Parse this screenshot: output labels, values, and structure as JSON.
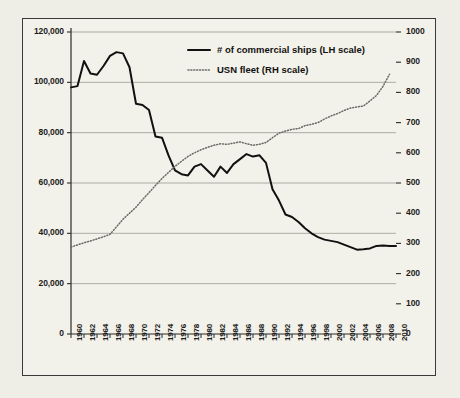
{
  "chart_data": {
    "type": "line",
    "title": "",
    "subtitle": "",
    "xlabel": "",
    "ylabel": "",
    "y2label": "",
    "grid": true,
    "legend_position": "top-center",
    "xlim": [
      1960,
      2010
    ],
    "ylim": [
      0,
      120000
    ],
    "y2lim": [
      0,
      1000
    ],
    "x_tick_labels": [
      "1960",
      "1962",
      "1964",
      "1966",
      "1968",
      "1970",
      "1972",
      "1974",
      "1976",
      "1978",
      "1980",
      "1982",
      "1984",
      "1986",
      "1988",
      "1990",
      "1992",
      "1994",
      "1996",
      "1998",
      "2000",
      "2002",
      "2004",
      "2006",
      "2008",
      "2010"
    ],
    "y_left_tick_labels": [
      "0",
      "20,000",
      "40,000",
      "60,000",
      "80,000",
      "100,000",
      "120,000"
    ],
    "y_left_tick_values": [
      0,
      20000,
      40000,
      60000,
      80000,
      100000,
      120000
    ],
    "y_right_tick_labels": [
      "0",
      "100",
      "200",
      "300",
      "400",
      "500",
      "600",
      "700",
      "800",
      "900",
      "1000"
    ],
    "y_right_tick_values": [
      0,
      100,
      200,
      300,
      400,
      500,
      600,
      700,
      800,
      900,
      1000
    ],
    "x": [
      1960,
      1961,
      1962,
      1963,
      1964,
      1965,
      1966,
      1967,
      1968,
      1969,
      1970,
      1971,
      1972,
      1973,
      1974,
      1975,
      1976,
      1977,
      1978,
      1979,
      1980,
      1981,
      1982,
      1983,
      1984,
      1985,
      1986,
      1987,
      1988,
      1989,
      1990,
      1991,
      1992,
      1993,
      1994,
      1995,
      1996,
      1997,
      1998,
      1999,
      2000,
      2001,
      2002,
      2003,
      2004,
      2005,
      2006,
      2007,
      2008,
      2009,
      2010
    ],
    "series": [
      {
        "name": "# of commercial ships (LH scale)",
        "axis": "left",
        "style": "solid",
        "color": "#111111",
        "values": [
          98000,
          98500,
          108500,
          103500,
          103000,
          106500,
          110500,
          112000,
          111500,
          106000,
          91500,
          91000,
          89000,
          78500,
          78000,
          71000,
          65000,
          63500,
          63000,
          66500,
          67500,
          65000,
          62500,
          66500,
          64000,
          67500,
          69500,
          71500,
          70500,
          71000,
          68000,
          57500,
          53000,
          47500,
          46500,
          44500,
          42000,
          40000,
          38500,
          37500,
          37000,
          36500,
          35500,
          34500,
          33500,
          33700,
          34000,
          35000,
          35200,
          35000,
          35000
        ]
      },
      {
        "name": "USN fleet (RH scale)",
        "axis": "right",
        "style": "dotted",
        "color": "#6b6b66",
        "values": [
          288,
          295,
          302,
          308,
          315,
          322,
          330,
          355,
          380,
          400,
          420,
          445,
          468,
          492,
          515,
          535,
          555,
          572,
          588,
          600,
          610,
          618,
          625,
          630,
          628,
          632,
          636,
          630,
          625,
          628,
          634,
          650,
          665,
          672,
          678,
          680,
          690,
          694,
          700,
          712,
          722,
          730,
          740,
          748,
          752,
          755,
          772,
          790,
          820,
          860,
          null
        ]
      }
    ]
  },
  "legend": {
    "items": [
      {
        "label": "# of commercial ships (LH scale)",
        "marker": "solid-line"
      },
      {
        "label": "USN fleet (RH scale)",
        "marker": "dotted-line"
      }
    ]
  },
  "colors": {
    "background": "#f3f2ea",
    "frame": "#3a3a38",
    "grid": "#9a9a93",
    "commercial_line": "#111111",
    "usn_line": "#6b6b66"
  }
}
